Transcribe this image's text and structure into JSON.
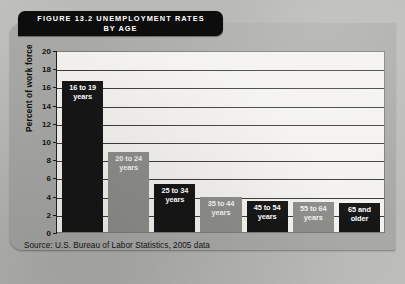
{
  "figure": {
    "banner_line_1": "FIGURE 13.2   UNEMPLOYMENT RATES",
    "banner_line_2": "BY AGE",
    "source_note": "Source: U.S. Bureau of Labor Statistics, 2005 data"
  },
  "colors": {
    "bar_dark": "#161616",
    "bar_light": "#8d8d8a",
    "plot_background": "#f3f2ee",
    "card_background": "#a8a8a6",
    "banner_background": "#0d0d0d",
    "gridline": "#3b3b3b"
  },
  "chart_data": {
    "type": "bar",
    "title": "FIGURE 13.2   UNEMPLOYMENT RATES BY AGE",
    "xlabel": "",
    "ylabel": "Percent of work force",
    "ylim": [
      0,
      20
    ],
    "ytick_step": 2,
    "yticks": [
      0,
      2,
      4,
      6,
      8,
      10,
      12,
      14,
      16,
      18,
      20
    ],
    "ytick_labels": [
      "0",
      "2",
      "4",
      "6",
      "8",
      "10",
      "12",
      "14",
      "16",
      "18",
      "20"
    ],
    "grid": true,
    "legend": "none",
    "categories": [
      "16 to 19 years",
      "20 to 24 years",
      "25 to 34 years",
      "35 to 44 years",
      "45 to 54 years",
      "55 to 64 years",
      "65 and older"
    ],
    "values": [
      16.6,
      8.8,
      5.3,
      3.8,
      3.4,
      3.3,
      3.2
    ],
    "bar_colors": [
      "dark",
      "light",
      "dark",
      "light",
      "dark",
      "light",
      "dark"
    ],
    "bar_labels": [
      {
        "line1": "16 to 19",
        "line2": "years"
      },
      {
        "line1": "20 to 24",
        "line2": "years"
      },
      {
        "line1": "25 to 34",
        "line2": "years"
      },
      {
        "line1": "35 to 44",
        "line2": "years"
      },
      {
        "line1": "45 to 54",
        "line2": "years"
      },
      {
        "line1": "55 to 64",
        "line2": "years"
      },
      {
        "line1": "65 and",
        "line2": "older"
      }
    ],
    "source": "Source: U.S. Bureau of Labor Statistics, 2005 data"
  }
}
